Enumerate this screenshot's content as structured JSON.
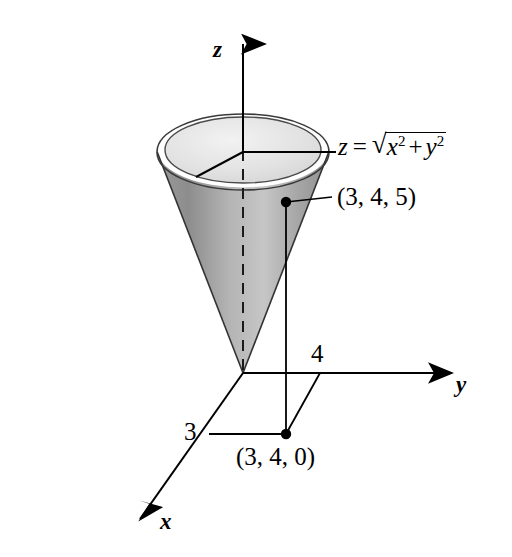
{
  "figure": {
    "background_color": "#ffffff",
    "ink_color": "#000000"
  },
  "axes": {
    "z": {
      "label": "z",
      "direction": "up"
    },
    "y": {
      "label": "y",
      "direction": "right"
    },
    "x": {
      "label": "x",
      "direction": "down-left"
    }
  },
  "ticks": [
    {
      "axis": "x",
      "label": "3"
    },
    {
      "axis": "y",
      "label": "4"
    }
  ],
  "equation": {
    "lhs": "z",
    "relation": "=",
    "radical_sign": "√",
    "term1_base": "x",
    "term1_exp": "2",
    "operator": "+",
    "term2_base": "y",
    "term2_exp": "2",
    "plain_text": "z = √(x² + y²)"
  },
  "points": [
    {
      "name": "point-3-4-5",
      "label": "(3, 4, 5)",
      "marker": "filled-dot",
      "has_leader_line": true
    },
    {
      "name": "point-3-4-0",
      "label": "(3, 4, 0)",
      "marker": "filled-dot",
      "has_leader_line": false
    }
  ],
  "surface": {
    "name": "cone",
    "fill_light": "#d9d9d9",
    "fill_mid": "#a8a8a8",
    "fill_dark": "#8f8f8f",
    "rim_top_fill": "#ececec",
    "outline_color": "#2b2b2b"
  },
  "guides": {
    "projection_line": "vertical segment from (3, 4, 5) down to (3, 4, 0)",
    "base_rectangle": "parallelogram through origin, x=3, (3,4,0), y=4",
    "axis_dashed_segment": "dashed z-axis inside cone"
  }
}
